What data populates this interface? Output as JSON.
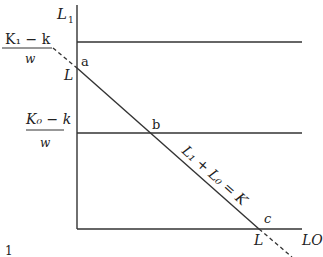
{
  "diagram": {
    "axes": {
      "y_label": "L",
      "y_label_sub": "1",
      "x_label": "LO"
    },
    "fractions": [
      {
        "numerator": "K₁ − k",
        "denominator": "w"
      },
      {
        "numerator": "K₀ − k",
        "denominator": "w"
      }
    ],
    "points": {
      "a": "a",
      "b": "b",
      "c": "c"
    },
    "axis_marks": {
      "y_L": "L",
      "x_L": "L"
    },
    "budget_line_label": "L₁ + L₀ = K",
    "footer_number": "1",
    "colors": {
      "line": "#333333",
      "text": "#222222",
      "background": "#ffffff"
    }
  }
}
